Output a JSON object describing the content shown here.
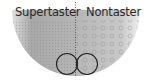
{
  "diagram": {
    "type": "tongue-papillae-comparison",
    "labels": {
      "left": "Supertaster",
      "right": "Nontaster"
    },
    "colors": {
      "fill": "#b4b4b4",
      "fill_light": "#d2d2d2",
      "divider": "#444444",
      "circle_stroke": "#222222",
      "text": "#2a2a2a"
    },
    "shapes": {
      "semicircle": "tongue-cross-section",
      "divider": "dotted-vertical-line",
      "circles": 2
    }
  }
}
